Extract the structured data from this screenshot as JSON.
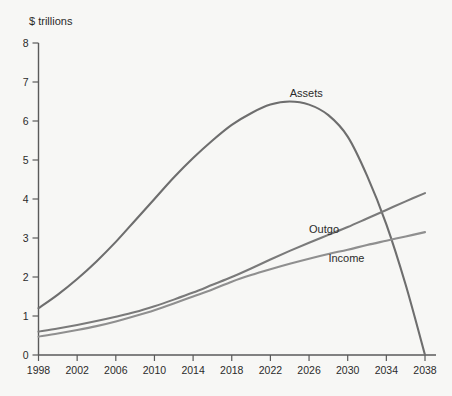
{
  "chart_data": {
    "type": "line",
    "title": "",
    "subtitle": "",
    "xlabel": "",
    "ylabel": "$ trillions",
    "xlim": [
      1998,
      2038
    ],
    "ylim": [
      0,
      8
    ],
    "grid": false,
    "legend_position": "inline-annotations",
    "x_ticks": [
      "1998",
      "2002",
      "2006",
      "2010",
      "2014",
      "2018",
      "2022",
      "2026",
      "2030",
      "2034",
      "2038"
    ],
    "y_ticks": [
      "0",
      "1",
      "2",
      "3",
      "4",
      "5",
      "6",
      "7",
      "8"
    ],
    "x": [
      1998,
      2000,
      2002,
      2004,
      2006,
      2008,
      2010,
      2012,
      2014,
      2016,
      2018,
      2020,
      2022,
      2024,
      2026,
      2028,
      2030,
      2032,
      2034,
      2036,
      2038
    ],
    "series": [
      {
        "name": "Assets",
        "color": "#6e6e6e",
        "label": "Assets",
        "values": [
          1.2,
          1.55,
          1.95,
          2.4,
          2.9,
          3.45,
          4.0,
          4.55,
          5.05,
          5.5,
          5.9,
          6.2,
          6.42,
          6.5,
          6.42,
          6.15,
          5.6,
          4.6,
          3.35,
          1.8,
          0.0
        ]
      },
      {
        "name": "Outgo",
        "color": "#7a7a7a",
        "label": "Outgo",
        "values": [
          0.6,
          0.68,
          0.77,
          0.87,
          0.98,
          1.1,
          1.25,
          1.42,
          1.6,
          1.8,
          2.0,
          2.22,
          2.45,
          2.67,
          2.88,
          3.08,
          3.28,
          3.5,
          3.72,
          3.94,
          4.15
        ]
      },
      {
        "name": "Income",
        "color": "#8f8f8f",
        "label": "Income",
        "values": [
          0.47,
          0.55,
          0.64,
          0.74,
          0.86,
          1.0,
          1.15,
          1.32,
          1.5,
          1.68,
          1.88,
          2.05,
          2.2,
          2.34,
          2.47,
          2.59,
          2.7,
          2.82,
          2.93,
          3.04,
          3.15
        ]
      }
    ],
    "annotations": [
      {
        "text": "Assets",
        "x": 2024,
        "y": 6.62
      },
      {
        "text": "Outgo",
        "x": 2026,
        "y": 3.12
      },
      {
        "text": "Income",
        "x": 2028,
        "y": 2.38
      }
    ]
  },
  "axes": {
    "y_axis_title": "$ trillions"
  }
}
